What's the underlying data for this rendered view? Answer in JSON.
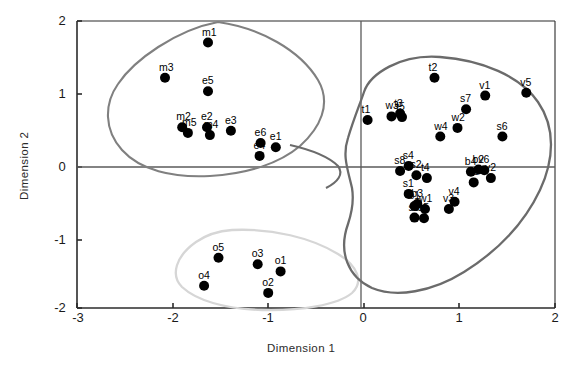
{
  "chart_data": {
    "type": "scatter",
    "title": "",
    "xlabel": "Dimension  1",
    "ylabel": "Dimension 2",
    "xlim": [
      -3,
      2
    ],
    "ylim": [
      -2,
      2
    ],
    "xticks": [
      "-3",
      "-2",
      "-1",
      "0",
      "1",
      "2"
    ],
    "yticks": [
      "-2",
      "-1",
      "0",
      "1",
      "2"
    ],
    "grid": false,
    "legend": "none",
    "reference_lines": {
      "x": 0,
      "y": 0
    },
    "marker": {
      "shape": "circle",
      "color": "#000000",
      "size": 5
    },
    "points": [
      {
        "label": "m1",
        "x": -1.63,
        "y": 1.7
      },
      {
        "label": "m3",
        "x": -2.08,
        "y": 1.21
      },
      {
        "label": "e5",
        "x": -1.63,
        "y": 1.02
      },
      {
        "label": "m2",
        "x": -1.9,
        "y": 0.52
      },
      {
        "label": "m5",
        "x": -1.84,
        "y": 0.44
      },
      {
        "label": "e2",
        "x": -1.64,
        "y": 0.52
      },
      {
        "label": "m4",
        "x": -1.61,
        "y": 0.41
      },
      {
        "label": "e3",
        "x": -1.39,
        "y": 0.47
      },
      {
        "label": "e6",
        "x": -1.08,
        "y": 0.3
      },
      {
        "label": "e4",
        "x": -1.09,
        "y": 0.12
      },
      {
        "label": "e1",
        "x": -0.92,
        "y": 0.24
      },
      {
        "label": "o5",
        "x": -1.52,
        "y": -1.3
      },
      {
        "label": "o3",
        "x": -1.11,
        "y": -1.39
      },
      {
        "label": "o1",
        "x": -0.87,
        "y": -1.49
      },
      {
        "label": "o4",
        "x": -1.67,
        "y": -1.69
      },
      {
        "label": "o2",
        "x": -1.0,
        "y": -1.79
      },
      {
        "label": "t1",
        "x": 0.04,
        "y": 0.62
      },
      {
        "label": "w3",
        "x": 0.29,
        "y": 0.67
      },
      {
        "label": "t3",
        "x": 0.38,
        "y": 0.71
      },
      {
        "label": "t5",
        "x": 0.4,
        "y": 0.66
      },
      {
        "label": "t2",
        "x": 0.74,
        "y": 1.21
      },
      {
        "label": "s7",
        "x": 1.07,
        "y": 0.77
      },
      {
        "label": "v1",
        "x": 1.27,
        "y": 0.96
      },
      {
        "label": "v5",
        "x": 1.7,
        "y": 1.0
      },
      {
        "label": "w2",
        "x": 0.98,
        "y": 0.51
      },
      {
        "label": "w4",
        "x": 0.8,
        "y": 0.39
      },
      {
        "label": "s6",
        "x": 1.45,
        "y": 0.39
      },
      {
        "label": "s8",
        "x": 0.38,
        "y": -0.09
      },
      {
        "label": "s4",
        "x": 0.47,
        "y": -0.02
      },
      {
        "label": "s2",
        "x": 0.55,
        "y": -0.15
      },
      {
        "label": "t4",
        "x": 0.66,
        "y": -0.19
      },
      {
        "label": "b4",
        "x": 1.12,
        "y": -0.1
      },
      {
        "label": "b2",
        "x": 1.2,
        "y": -0.07
      },
      {
        "label": "v6",
        "x": 1.26,
        "y": -0.08
      },
      {
        "label": "v2",
        "x": 1.33,
        "y": -0.19
      },
      {
        "label": "b5",
        "x": 1.15,
        "y": -0.25
      },
      {
        "label": "s1",
        "x": 0.47,
        "y": -0.41
      },
      {
        "label": "b3",
        "x": 0.56,
        "y": -0.55
      },
      {
        "label": "b1",
        "x": 0.53,
        "y": -0.58
      },
      {
        "label": "w1",
        "x": 0.64,
        "y": -0.62
      },
      {
        "label": "s3",
        "x": 0.53,
        "y": -0.74
      },
      {
        "label": "s5",
        "x": 0.63,
        "y": -0.75
      },
      {
        "label": "v4",
        "x": 0.95,
        "y": -0.52
      },
      {
        "label": "v3",
        "x": 0.89,
        "y": -0.62
      }
    ],
    "clusters": [
      {
        "name": "cluster-left-upper",
        "color": "#808080",
        "members": [
          "m1",
          "m3",
          "e5",
          "m2",
          "m5",
          "e2",
          "m4",
          "e3",
          "e6",
          "e4",
          "e1"
        ]
      },
      {
        "name": "cluster-bottom",
        "color": "#d6d6d6",
        "members": [
          "o5",
          "o3",
          "o1",
          "o4",
          "o2"
        ]
      },
      {
        "name": "cluster-right",
        "color": "#6b6b6b",
        "members": [
          "t1",
          "w3",
          "t3",
          "t5",
          "t2",
          "s7",
          "v1",
          "v5",
          "w2",
          "w4",
          "s6",
          "s8",
          "s4",
          "s2",
          "t4",
          "b4",
          "b2",
          "v6",
          "v2",
          "b5",
          "s1",
          "b3",
          "b1",
          "w1",
          "s3",
          "s5",
          "v4",
          "v3"
        ]
      }
    ]
  }
}
